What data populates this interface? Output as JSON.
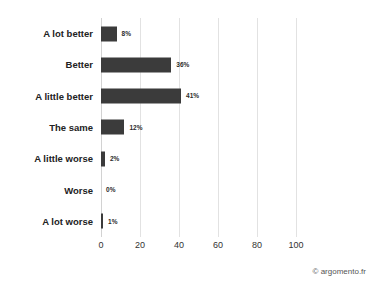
{
  "chart_data": {
    "type": "bar",
    "orientation": "horizontal",
    "title": "",
    "subtitle": "",
    "xlabel": "",
    "ylabel": "",
    "categories": [
      "A lot better",
      "Better",
      "A little better",
      "The same",
      "A little worse",
      "Worse",
      "A lot worse"
    ],
    "values": [
      8,
      36,
      41,
      12,
      2,
      0,
      1
    ],
    "data_labels": [
      "8%",
      "36%",
      "41%",
      "12%",
      "2%",
      "0%",
      "1%"
    ],
    "xlim": [
      0,
      100
    ],
    "ylim": null,
    "xticks": [
      0,
      20,
      40,
      60,
      80,
      100
    ],
    "xtick_labels": [
      "0",
      "20",
      "40",
      "60",
      "80",
      "100"
    ],
    "grid": "vertical",
    "legend": null,
    "legend_position": "none",
    "bar_color": "#3b3b3b",
    "gridline_color": "#e2e2e2",
    "background_color": "#ffffff"
  },
  "footer": {
    "credit": "© argomento.fr"
  }
}
